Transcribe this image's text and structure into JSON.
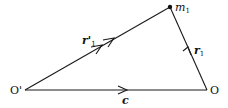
{
  "diagram": {
    "points": {
      "O_prime": {
        "label": "O'",
        "x": 25,
        "y": 90
      },
      "O": {
        "label": "O",
        "x": 207,
        "y": 90
      },
      "m1": {
        "label": "m",
        "sub": "1",
        "x": 170,
        "y": 7
      }
    },
    "vectors": [
      {
        "name": "r_prime_1",
        "label": "r'",
        "sub": "1",
        "from": "O_prime",
        "to": "m1"
      },
      {
        "name": "r_1",
        "label": "r",
        "sub": "1",
        "from": "O",
        "to": "m1"
      },
      {
        "name": "c",
        "label": "c",
        "sub": "",
        "from": "O_prime",
        "to": "O"
      }
    ],
    "line_color": "#1a1a1a"
  }
}
